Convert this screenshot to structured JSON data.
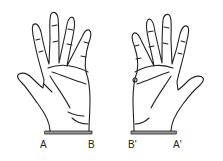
{
  "figure": {
    "left_hand": {
      "labels": {
        "left": "A",
        "right": "B"
      }
    },
    "right_hand": {
      "labels": {
        "left": "B'",
        "right": "A'"
      }
    },
    "colors": {
      "stroke": "#222222",
      "background": "#ffffff"
    }
  }
}
